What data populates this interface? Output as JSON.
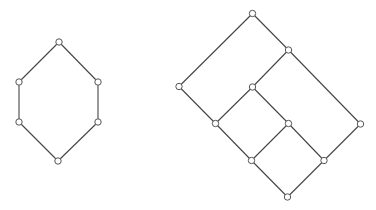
{
  "diagrams": [
    {
      "name": "hexagon-lattice",
      "nodes": [
        {
          "id": "top",
          "x": 59,
          "y": 42
        },
        {
          "id": "ul",
          "x": 19,
          "y": 82
        },
        {
          "id": "ur",
          "x": 98,
          "y": 82
        },
        {
          "id": "ll",
          "x": 19,
          "y": 122
        },
        {
          "id": "lr",
          "x": 98,
          "y": 122
        },
        {
          "id": "bottom",
          "x": 58,
          "y": 161
        }
      ],
      "edges": [
        [
          "top",
          "ul"
        ],
        [
          "top",
          "ur"
        ],
        [
          "ul",
          "ll"
        ],
        [
          "ur",
          "lr"
        ],
        [
          "ll",
          "bottom"
        ],
        [
          "lr",
          "bottom"
        ]
      ]
    },
    {
      "name": "grid-lattice",
      "nodes": [
        {
          "id": "A",
          "x": 252.5,
          "y": 13.5
        },
        {
          "id": "B",
          "x": 288.5,
          "y": 50
        },
        {
          "id": "C",
          "x": 179,
          "y": 86.5
        },
        {
          "id": "D",
          "x": 252.5,
          "y": 87
        },
        {
          "id": "E",
          "x": 215.5,
          "y": 123.5
        },
        {
          "id": "F",
          "x": 288.5,
          "y": 123.5
        },
        {
          "id": "G",
          "x": 360.5,
          "y": 124
        },
        {
          "id": "H",
          "x": 251.5,
          "y": 160.5
        },
        {
          "id": "I",
          "x": 324,
          "y": 160.5
        },
        {
          "id": "J",
          "x": 287.5,
          "y": 197
        }
      ],
      "edges": [
        [
          "A",
          "B"
        ],
        [
          "A",
          "C"
        ],
        [
          "B",
          "D"
        ],
        [
          "B",
          "G"
        ],
        [
          "C",
          "E"
        ],
        [
          "D",
          "E"
        ],
        [
          "D",
          "F"
        ],
        [
          "E",
          "H"
        ],
        [
          "F",
          "H"
        ],
        [
          "F",
          "I"
        ],
        [
          "G",
          "I"
        ],
        [
          "H",
          "J"
        ],
        [
          "I",
          "J"
        ]
      ]
    }
  ],
  "style": {
    "edge_color": "#444444",
    "node_stroke": "#555555",
    "node_fill": "#ffffff",
    "node_radius": 3.2
  }
}
